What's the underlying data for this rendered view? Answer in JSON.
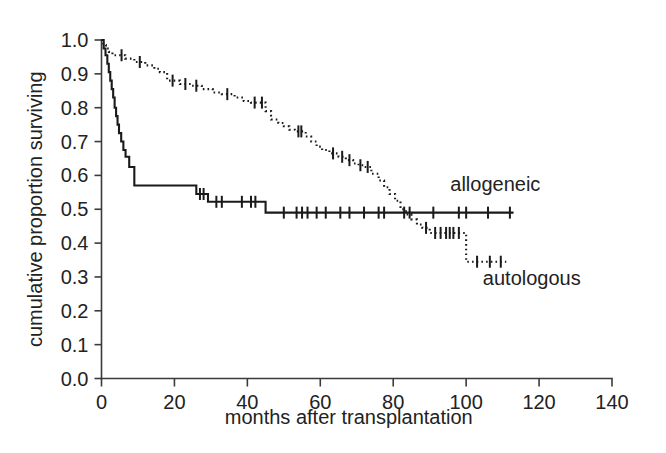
{
  "chart_data": {
    "type": "line",
    "subtype": "kaplan-meier-survival",
    "title": "",
    "xlabel": "months after transplantation",
    "ylabel": "cumulative proportion surviving",
    "xlim": [
      0,
      140
    ],
    "ylim": [
      0.0,
      1.0
    ],
    "xticks": [
      0,
      20,
      40,
      60,
      80,
      100,
      120,
      140
    ],
    "xtick_labels": [
      "0",
      "20",
      "40",
      "60",
      "80",
      "100",
      "120",
      "140"
    ],
    "yticks": [
      0.0,
      0.1,
      0.2,
      0.3,
      0.4,
      0.5,
      0.6,
      0.7,
      0.8,
      0.9,
      1.0
    ],
    "ytick_labels": [
      "0.0",
      "0.1",
      "0.2",
      "0.3",
      "0.4",
      "0.5",
      "0.6",
      "0.7",
      "0.8",
      "0.9",
      "1.0"
    ],
    "grid": false,
    "legend_position": "inline-annotation",
    "line_color": "#1a1a1a",
    "axis_color": "#3b3b3b",
    "background_color": "#ffffff",
    "annotations": [
      {
        "name": "allogeneic",
        "text": "allogeneic",
        "x": 108,
        "y": 0.555
      },
      {
        "name": "autologous",
        "text": "autologous",
        "x": 118,
        "y": 0.275
      }
    ],
    "series": [
      {
        "name": "allogeneic",
        "style": "solid",
        "label": "allogeneic",
        "steps": [
          [
            0.0,
            1.0
          ],
          [
            0.6,
            0.975
          ],
          [
            1.1,
            0.955
          ],
          [
            1.6,
            0.93
          ],
          [
            2.0,
            0.905
          ],
          [
            2.4,
            0.88
          ],
          [
            2.8,
            0.855
          ],
          [
            3.2,
            0.83
          ],
          [
            3.6,
            0.8
          ],
          [
            4.0,
            0.775
          ],
          [
            4.4,
            0.75
          ],
          [
            4.8,
            0.725
          ],
          [
            5.4,
            0.7
          ],
          [
            6.0,
            0.675
          ],
          [
            6.6,
            0.655
          ],
          [
            7.4,
            0.655
          ],
          [
            7.6,
            0.625
          ],
          [
            8.8,
            0.625
          ],
          [
            9.0,
            0.57
          ],
          [
            25.5,
            0.57
          ],
          [
            26.0,
            0.545
          ],
          [
            29.0,
            0.545
          ],
          [
            29.2,
            0.522
          ],
          [
            44.5,
            0.522
          ],
          [
            45.0,
            0.49
          ],
          [
            113.0,
            0.49
          ]
        ],
        "censor_marks": [
          [
            27.0,
            0.545
          ],
          [
            28.0,
            0.545
          ],
          [
            31.5,
            0.522
          ],
          [
            33.0,
            0.522
          ],
          [
            38.5,
            0.522
          ],
          [
            41.0,
            0.522
          ],
          [
            42.2,
            0.522
          ],
          [
            50.0,
            0.49
          ],
          [
            53.5,
            0.49
          ],
          [
            55.0,
            0.49
          ],
          [
            56.5,
            0.49
          ],
          [
            59.0,
            0.49
          ],
          [
            61.5,
            0.49
          ],
          [
            65.5,
            0.49
          ],
          [
            68.0,
            0.49
          ],
          [
            72.0,
            0.49
          ],
          [
            76.0,
            0.49
          ],
          [
            77.5,
            0.49
          ],
          [
            83.0,
            0.49
          ],
          [
            84.5,
            0.49
          ],
          [
            91.0,
            0.49
          ],
          [
            98.0,
            0.49
          ],
          [
            100.0,
            0.49
          ],
          [
            106.0,
            0.49
          ],
          [
            112.0,
            0.49
          ]
        ]
      },
      {
        "name": "autologous",
        "style": "dotted",
        "label": "autologous",
        "steps": [
          [
            0.0,
            1.0
          ],
          [
            0.5,
            0.985
          ],
          [
            1.2,
            0.975
          ],
          [
            2.0,
            0.965
          ],
          [
            3.0,
            0.955
          ],
          [
            4.5,
            0.955
          ],
          [
            6.5,
            0.945
          ],
          [
            9.0,
            0.935
          ],
          [
            12.0,
            0.925
          ],
          [
            14.5,
            0.915
          ],
          [
            16.0,
            0.905
          ],
          [
            18.0,
            0.88
          ],
          [
            21.5,
            0.87
          ],
          [
            24.5,
            0.865
          ],
          [
            27.5,
            0.855
          ],
          [
            30.5,
            0.845
          ],
          [
            33.0,
            0.84
          ],
          [
            36.5,
            0.83
          ],
          [
            39.0,
            0.82
          ],
          [
            41.0,
            0.815
          ],
          [
            43.0,
            0.815
          ],
          [
            45.0,
            0.79
          ],
          [
            46.5,
            0.765
          ],
          [
            48.5,
            0.755
          ],
          [
            50.0,
            0.745
          ],
          [
            51.5,
            0.735
          ],
          [
            53.0,
            0.73
          ],
          [
            55.0,
            0.73
          ],
          [
            56.0,
            0.715
          ],
          [
            57.5,
            0.7
          ],
          [
            59.0,
            0.685
          ],
          [
            60.5,
            0.675
          ],
          [
            62.5,
            0.665
          ],
          [
            65.0,
            0.655
          ],
          [
            67.0,
            0.645
          ],
          [
            69.0,
            0.635
          ],
          [
            70.5,
            0.63
          ],
          [
            72.0,
            0.625
          ],
          [
            74.0,
            0.605
          ],
          [
            76.0,
            0.585
          ],
          [
            77.5,
            0.565
          ],
          [
            79.0,
            0.545
          ],
          [
            80.5,
            0.525
          ],
          [
            82.0,
            0.5
          ],
          [
            83.5,
            0.485
          ],
          [
            85.0,
            0.47
          ],
          [
            86.5,
            0.455
          ],
          [
            88.0,
            0.445
          ],
          [
            90.0,
            0.43
          ],
          [
            99.5,
            0.43
          ],
          [
            100.0,
            0.345
          ],
          [
            111.0,
            0.345
          ]
        ],
        "censor_marks": [
          [
            5.5,
            0.955
          ],
          [
            10.5,
            0.935
          ],
          [
            19.5,
            0.88
          ],
          [
            23.0,
            0.87
          ],
          [
            26.0,
            0.865
          ],
          [
            34.5,
            0.84
          ],
          [
            42.0,
            0.815
          ],
          [
            44.0,
            0.815
          ],
          [
            54.0,
            0.73
          ],
          [
            54.8,
            0.73
          ],
          [
            63.5,
            0.665
          ],
          [
            66.0,
            0.655
          ],
          [
            68.0,
            0.645
          ],
          [
            71.0,
            0.63
          ],
          [
            73.0,
            0.625
          ],
          [
            89.0,
            0.445
          ],
          [
            91.5,
            0.43
          ],
          [
            93.0,
            0.43
          ],
          [
            94.5,
            0.43
          ],
          [
            95.5,
            0.43
          ],
          [
            96.5,
            0.43
          ],
          [
            98.0,
            0.43
          ],
          [
            103.0,
            0.345
          ],
          [
            106.5,
            0.345
          ],
          [
            109.5,
            0.345
          ]
        ]
      }
    ]
  },
  "axes": {
    "x_title": "months after transplantation",
    "y_title": "cumulative proportion surviving"
  }
}
